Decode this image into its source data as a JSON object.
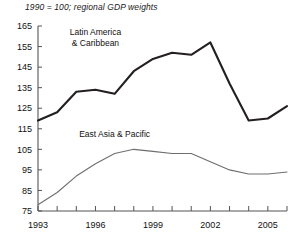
{
  "chart_data": {
    "type": "line",
    "title": "1990 = 100; regional GDP weights",
    "xlabel": "",
    "ylabel": "",
    "xlim": [
      1993,
      2006
    ],
    "ylim": [
      75,
      165
    ],
    "ytick_step": 10,
    "grid": false,
    "legend": "inline-annotation",
    "yticks": [
      75,
      85,
      95,
      105,
      115,
      125,
      135,
      145,
      155,
      165
    ],
    "ytick_labels": [
      "75",
      "85",
      "95",
      "105",
      "115",
      "125",
      "135",
      "145",
      "155",
      "165"
    ],
    "x": [
      1993,
      1994,
      1995,
      1996,
      1997,
      1998,
      1999,
      2000,
      2001,
      2002,
      2003,
      2004,
      2005,
      2006
    ],
    "xticks": [
      1993,
      1994,
      1995,
      1996,
      1997,
      1998,
      1999,
      2000,
      2001,
      2002,
      2003,
      2004,
      2005,
      2006
    ],
    "xtick_labels": [
      "1993",
      "",
      "",
      "1996",
      "",
      "",
      "1999",
      "",
      "",
      "2002",
      "",
      "",
      "2005",
      ""
    ],
    "series": [
      {
        "name": "Latin America & Caribbean",
        "label_line1": "Latin America",
        "label_line2": "& Caribbean",
        "color": "#231f20",
        "width": 2.1,
        "values": [
          119,
          123,
          133,
          134,
          132,
          143,
          149,
          152,
          151,
          157,
          137,
          119,
          120,
          126
        ]
      },
      {
        "name": "East Asia & Pacific",
        "label_line1": "East Asia & Pacific",
        "label_line2": "",
        "color": "#6e6e6e",
        "width": 1.1,
        "values": [
          78,
          84,
          92,
          98,
          103,
          105,
          104,
          103,
          103,
          99,
          95,
          93,
          93,
          94
        ]
      }
    ]
  },
  "annotations": {
    "latam_label_x": 1996.0,
    "latam_label_y": 160.5,
    "eap_label_x": 1997.0,
    "eap_label_y": 111.0
  },
  "colors": {
    "axis": "#555555",
    "text": "#111111",
    "background": "#ffffff",
    "latam": "#231f20",
    "eap": "#6e6e6e"
  }
}
